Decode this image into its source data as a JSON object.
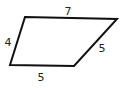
{
  "figure": {
    "shape": "quadrilateral",
    "stroke_color": "#111111",
    "stroke_width": 2,
    "vertices": [
      {
        "name": "top-left",
        "x": 25,
        "y": 17
      },
      {
        "name": "top-right",
        "x": 117,
        "y": 19
      },
      {
        "name": "bottom-right",
        "x": 74,
        "y": 66
      },
      {
        "name": "bottom-left",
        "x": 10,
        "y": 65
      }
    ],
    "sides": [
      {
        "id": "top",
        "label": "7",
        "label_x": 68,
        "label_y": 11
      },
      {
        "id": "right",
        "label": "5",
        "label_x": 102,
        "label_y": 48
      },
      {
        "id": "bottom",
        "label": "5",
        "label_x": 41,
        "label_y": 77
      },
      {
        "id": "left",
        "label": "4",
        "label_x": 8,
        "label_y": 42
      }
    ]
  }
}
